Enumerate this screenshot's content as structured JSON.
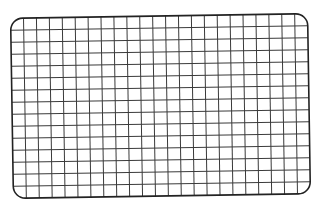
{
  "figure": {
    "shape": "rounded-rectangle-grid",
    "background_color": "#ffffff",
    "grid": {
      "columns": 23,
      "rows": 15,
      "line_color": "#3a3a3a",
      "line_width": 1
    },
    "border": {
      "color": "#222222",
      "width": 1.6,
      "corner_radius": 12
    },
    "geometry": {
      "center_x": 160.5,
      "center_y": 106,
      "width": 297,
      "height": 180,
      "rotation_deg": -0.9
    }
  }
}
